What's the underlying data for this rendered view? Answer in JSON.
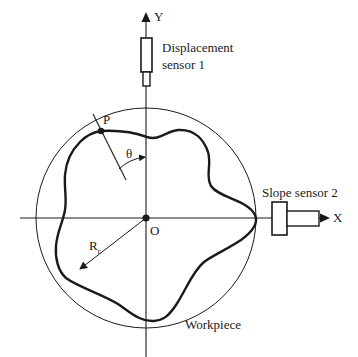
{
  "diagram": {
    "axes": {
      "x_label": "X",
      "y_label": "Y",
      "origin_label": "O"
    },
    "sensors": {
      "displacement": {
        "line1": "Displacement",
        "line2": "sensor 1"
      },
      "slope": {
        "label": "Slope sensor 2"
      }
    },
    "workpiece_label": "Workpiece",
    "point_label": "P",
    "angle_label": "θ",
    "radius_label": {
      "main": "R",
      "subscript": "r"
    },
    "colors": {
      "stroke": "#1a1a1a",
      "background": "#ffffff"
    }
  }
}
